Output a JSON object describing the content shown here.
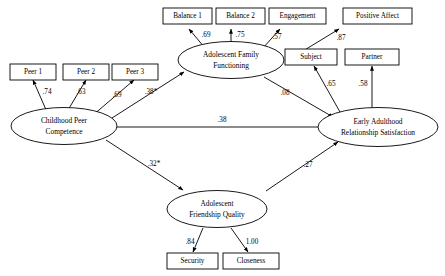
{
  "diagram": {
    "type": "structural-equation-model-path-diagram",
    "latent_variables": [
      {
        "id": "peer_competence",
        "label_line1": "Childhood Peer",
        "label_line2": "Competence"
      },
      {
        "id": "family_functioning",
        "label_line1": "Adolescent Family",
        "label_line2": "Functioning"
      },
      {
        "id": "friendship_quality",
        "label_line1": "Adolescent",
        "label_line2": "Friendship Quality"
      },
      {
        "id": "relationship_satisfaction",
        "label_line1": "Early Adulthood",
        "label_line2": "Relationship Satisfaction"
      }
    ],
    "observed_variables": [
      {
        "id": "peer1",
        "label": "Peer 1"
      },
      {
        "id": "peer2",
        "label": "Peer 2"
      },
      {
        "id": "peer3",
        "label": "Peer 3"
      },
      {
        "id": "balance1",
        "label": "Balance 1"
      },
      {
        "id": "balance2",
        "label": "Balance 2"
      },
      {
        "id": "engagement",
        "label": "Engagement"
      },
      {
        "id": "positive_affect",
        "label": "Positive Affect"
      },
      {
        "id": "subject",
        "label": "Subject"
      },
      {
        "id": "partner",
        "label": "Partner"
      },
      {
        "id": "security",
        "label": "Security"
      },
      {
        "id": "closeness",
        "label": "Closeness"
      }
    ],
    "measurement_loadings": [
      {
        "from": "peer_competence",
        "to": "peer1",
        "value": ".74"
      },
      {
        "from": "peer_competence",
        "to": "peer2",
        "value": ".63"
      },
      {
        "from": "peer_competence",
        "to": "peer3",
        "value": ".69"
      },
      {
        "from": "family_functioning",
        "to": "balance1",
        "value": ".69"
      },
      {
        "from": "family_functioning",
        "to": "balance2",
        "value": ".75"
      },
      {
        "from": "family_functioning",
        "to": "engagement",
        "value": ".57"
      },
      {
        "from": "family_functioning",
        "to": "positive_affect",
        "value": ".87"
      },
      {
        "from": "relationship_satisfaction",
        "to": "subject",
        "value": ".65"
      },
      {
        "from": "relationship_satisfaction",
        "to": "partner",
        "value": ".58"
      },
      {
        "from": "friendship_quality",
        "to": "security",
        "value": ".84"
      },
      {
        "from": "friendship_quality",
        "to": "closeness",
        "value": "1.00"
      }
    ],
    "structural_paths": [
      {
        "from": "peer_competence",
        "to": "family_functioning",
        "value": ".38*"
      },
      {
        "from": "peer_competence",
        "to": "relationship_satisfaction",
        "value": ".38"
      },
      {
        "from": "peer_competence",
        "to": "friendship_quality",
        "value": ".32*"
      },
      {
        "from": "family_functioning",
        "to": "relationship_satisfaction",
        "value": ".08"
      },
      {
        "from": "friendship_quality",
        "to": "relationship_satisfaction",
        "value": ".27"
      }
    ],
    "colors": {
      "stroke": "#000000",
      "background": "#ffffff"
    }
  }
}
